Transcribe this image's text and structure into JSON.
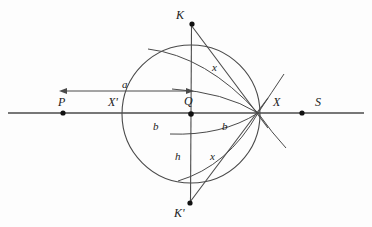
{
  "figure": {
    "kind": "geometry-construction-diagram",
    "background_color": "#fdfdfd",
    "stroke_color": "#3a3a3a",
    "text_color": "#1a1a1a",
    "width": 372,
    "height": 227
  },
  "baseline": {
    "name": "horizontal-line-PS",
    "y": 113,
    "x_start": 8,
    "x_end": 364
  },
  "circle": {
    "name": "main-circle",
    "cx": 191,
    "cy": 114,
    "r": 69
  },
  "points": [
    {
      "id": "P",
      "label": "P",
      "dot_x": 63,
      "dot_y": 113,
      "label_x": 58,
      "label_y": 96
    },
    {
      "id": "Xp",
      "label": "X'",
      "dot_x": 124,
      "dot_y": 113,
      "label_x": 110,
      "label_y": 96
    },
    {
      "id": "Q",
      "label": "Q",
      "dot_x": 191,
      "dot_y": 114,
      "label_x": 184,
      "label_y": 96
    },
    {
      "id": "X",
      "label": "X",
      "dot_x": 258,
      "dot_y": 113,
      "label_x": 273,
      "label_y": 96
    },
    {
      "id": "S",
      "label": "S",
      "dot_x": 302,
      "dot_y": 113,
      "label_x": 316,
      "label_y": 96
    },
    {
      "id": "K",
      "label": "K",
      "dot_x": 192,
      "dot_y": 24,
      "label_x": 176,
      "label_y": 9
    },
    {
      "id": "Kp",
      "label": "K'",
      "dot_x": 190,
      "dot_y": 203,
      "label_x": 175,
      "label_y": 207
    }
  ],
  "segment_labels": [
    {
      "id": "a",
      "label": "a",
      "x": 124,
      "y": 80
    },
    {
      "id": "b-left",
      "label": "b",
      "x": 153,
      "y": 122
    },
    {
      "id": "b-right",
      "label": "b",
      "x": 222,
      "y": 122
    },
    {
      "id": "h",
      "label": "h",
      "x": 176,
      "y": 152
    },
    {
      "id": "x-top",
      "label": "x",
      "x": 212,
      "y": 63
    },
    {
      "id": "x-bottom",
      "label": "x",
      "x": 211,
      "y": 152
    }
  ],
  "measure_arrow": {
    "name": "a-double-arrow",
    "y": 91,
    "x_left": 60,
    "x_right": 193,
    "direction": "both"
  },
  "chords": [
    {
      "name": "chord-K-to-X",
      "x1": 192,
      "y1": 24,
      "x2": 258,
      "y2": 113
    },
    {
      "name": "chord-Kp-to-X",
      "x1": 190,
      "y1": 203,
      "x2": 258,
      "y2": 113
    },
    {
      "name": "vertical-KKp-through-Q",
      "x1": 191,
      "y1": 24,
      "x2": 190,
      "y2": 203
    }
  ],
  "arcs": [
    {
      "name": "arc-upper-outer-to-X"
    },
    {
      "name": "arc-upper-inner-to-X"
    },
    {
      "name": "arc-lower-inner-to-X"
    },
    {
      "name": "arc-lower-outer-to-X"
    },
    {
      "name": "tangent-ray-upper-right"
    },
    {
      "name": "tangent-ray-lower-right"
    }
  ]
}
